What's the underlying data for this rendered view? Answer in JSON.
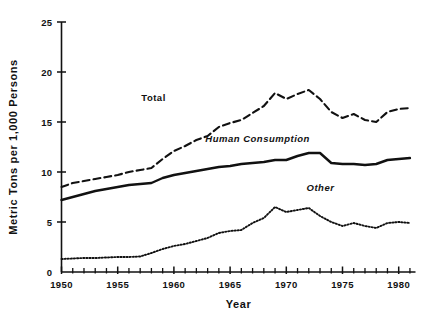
{
  "chart_data": {
    "type": "line",
    "title": "",
    "xlabel": "Year",
    "ylabel": "Metric Tons per 1,000 Persons",
    "xlim": [
      1950,
      1981
    ],
    "ylim": [
      0,
      25
    ],
    "yticks": [
      0,
      5,
      10,
      15,
      20,
      25
    ],
    "ytick_labels": [
      "0",
      "5",
      "10",
      "15",
      "20",
      "25"
    ],
    "xticks": [
      1950,
      1955,
      1960,
      1965,
      1970,
      1975,
      1980
    ],
    "xtick_labels": [
      "1950",
      "1955",
      "1960",
      "1965",
      "1970",
      "1975",
      "1980"
    ],
    "minor_xtick_interval": 1,
    "grid": false,
    "legend_position": "inline-annotations",
    "x": [
      1950,
      1951,
      1952,
      1953,
      1954,
      1955,
      1956,
      1957,
      1958,
      1959,
      1960,
      1961,
      1962,
      1963,
      1964,
      1965,
      1966,
      1967,
      1968,
      1969,
      1970,
      1971,
      1972,
      1973,
      1974,
      1975,
      1976,
      1977,
      1978,
      1979,
      1980,
      1981
    ],
    "series": [
      {
        "name": "Total",
        "label": "Total",
        "style": "dashed",
        "values": [
          8.5,
          8.9,
          9.1,
          9.3,
          9.5,
          9.7,
          10.0,
          10.2,
          10.4,
          11.3,
          12.1,
          12.6,
          13.2,
          13.6,
          14.5,
          14.9,
          15.2,
          15.9,
          16.6,
          17.9,
          17.3,
          17.8,
          18.2,
          17.3,
          16.0,
          15.4,
          15.8,
          15.2,
          15.0,
          16.0,
          16.3,
          16.4
        ]
      },
      {
        "name": "Human Consumption",
        "label": "Human Consumption",
        "style": "solid",
        "values": [
          7.2,
          7.5,
          7.8,
          8.1,
          8.3,
          8.5,
          8.7,
          8.8,
          8.9,
          9.4,
          9.7,
          9.9,
          10.1,
          10.3,
          10.5,
          10.6,
          10.8,
          10.9,
          11.0,
          11.2,
          11.2,
          11.6,
          11.9,
          11.9,
          10.9,
          10.8,
          10.8,
          10.7,
          10.8,
          11.2,
          11.3,
          11.4
        ]
      },
      {
        "name": "Other",
        "label": "Other",
        "style": "dotted",
        "values": [
          1.3,
          1.35,
          1.4,
          1.4,
          1.45,
          1.5,
          1.5,
          1.55,
          1.9,
          2.3,
          2.6,
          2.8,
          3.1,
          3.4,
          3.9,
          4.1,
          4.2,
          4.9,
          5.4,
          6.5,
          6.0,
          6.2,
          6.4,
          5.6,
          5.0,
          4.6,
          4.9,
          4.6,
          4.4,
          4.9,
          5.0,
          4.9
        ]
      }
    ],
    "annotations": [
      {
        "text": "Total",
        "x": 1957.1,
        "y": 17.1,
        "italic": false
      },
      {
        "text": "Human Consumption",
        "x": 1962.8,
        "y": 13.0,
        "italic": true
      },
      {
        "text": "Other",
        "x": 1971.8,
        "y": 8.1,
        "italic": true
      }
    ]
  },
  "colors": {
    "ink": "#111111",
    "background": "#ffffff"
  }
}
